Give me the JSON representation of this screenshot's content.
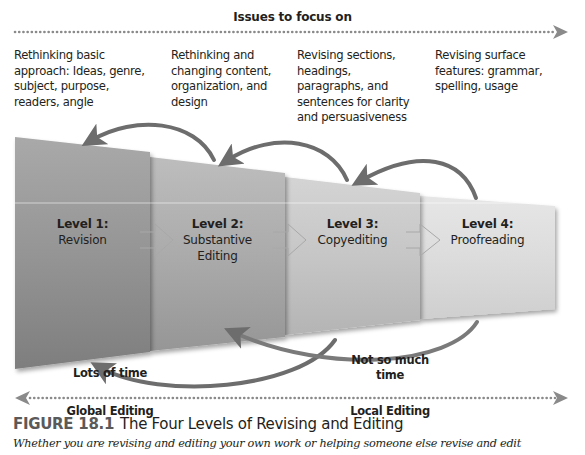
{
  "header": {
    "label": "Issues to focus on"
  },
  "issues": [
    {
      "text": "Rethinking basic approach: Ideas, genre, subject, purpose, readers, angle"
    },
    {
      "text": "Rethinking and changing content, organization, and design"
    },
    {
      "text": "Revising sections, headings, paragraphs, and sentences for clarity and persuasiveness"
    },
    {
      "text": "Revising surface features: grammar, spelling, usage"
    }
  ],
  "issues_lines": [
    [
      "Rethinking basic",
      "approach: Ideas, genre,",
      "subject, purpose,",
      "readers, angle"
    ],
    [
      "Rethinking and",
      "changing content,",
      "organization, and",
      "design"
    ],
    [
      "Revising sections,",
      "headings,",
      "paragraphs, and",
      "sentences for clarity",
      "and persuasiveness"
    ],
    [
      "Revising surface",
      "features: grammar,",
      "spelling, usage"
    ]
  ],
  "levels": [
    {
      "level": "Level 1:",
      "name": "Revision"
    },
    {
      "level": "Level 2:",
      "name": "Substantive Editing",
      "name_lines": [
        "Substantive",
        "Editing"
      ]
    },
    {
      "level": "Level 3:",
      "name": "Copyediting"
    },
    {
      "level": "Level 4:",
      "name": "Proofreading"
    }
  ],
  "time": {
    "left": "Lots of time",
    "right_line1": "Not so much",
    "right_line2": "time"
  },
  "editing": {
    "global": "Global Editing",
    "local": "Local Editing"
  },
  "figure": {
    "number": "FIGURE 18.1",
    "title": "The Four Levels of Revising and Editing",
    "caption": "Whether you are revising and editing your own work or helping someone else revise and edit"
  },
  "colors": {
    "arrow": "#6d6d6d",
    "dots": "#8a8a8a",
    "panel_dark": "#8e8e8e",
    "panel_light": "#dcdcdc",
    "figure_number": "#5a5a5a"
  }
}
